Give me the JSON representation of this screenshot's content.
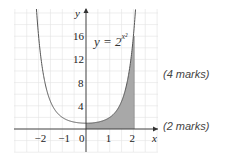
{
  "figure": {
    "equation_lhs": "y = 2",
    "equation_exp": "x²",
    "axis_x_label": "x",
    "axis_y_label": "y",
    "x_ticks": [
      "−2",
      "−1",
      "0",
      "1",
      "2"
    ],
    "y_ticks": [
      "4",
      "8",
      "12",
      "16"
    ],
    "shaded_region": "area under curve from x = 0 to x = 2",
    "colors": {
      "curve": "#555555",
      "shade": "#a8a8a8",
      "grid": "#e2e2e2",
      "axis": "#333333"
    }
  },
  "marks": [
    {
      "label": "(4 marks)"
    },
    {
      "label": "(2 marks)"
    }
  ],
  "chart_data": {
    "type": "line",
    "xlabel": "x",
    "ylabel": "y",
    "x": [
      -2,
      -1.5,
      -1,
      -0.5,
      0,
      0.5,
      1,
      1.5,
      2
    ],
    "series": [
      {
        "name": "y = 2^(x^2)",
        "values": [
          16,
          4.76,
          2,
          1.19,
          1,
          1.19,
          2,
          4.76,
          16
        ]
      }
    ],
    "xlim": [
      -3,
      2.8
    ],
    "ylim": [
      -4,
      20
    ],
    "x_tick_labels": [
      "-2",
      "-1",
      "0",
      "1",
      "2"
    ],
    "y_tick_labels": [
      "4",
      "8",
      "12",
      "16"
    ],
    "grid": true,
    "shaded": {
      "from_x": 0,
      "to_x": 2
    }
  }
}
